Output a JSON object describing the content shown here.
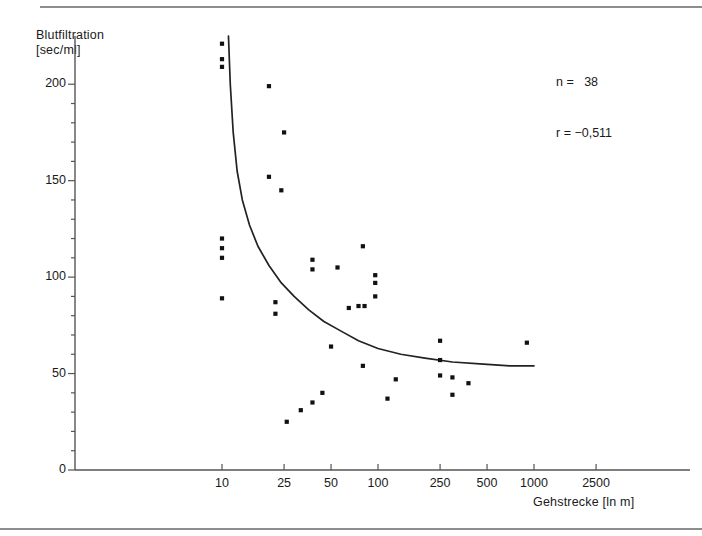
{
  "figure": {
    "background": "#ffffff",
    "ink": "#1a1a1a",
    "rule_color": "#8d8d8d"
  },
  "stats": {
    "n_label": "n =   38",
    "r_label": "r = −0,511"
  },
  "axes": {
    "y_title_line1": "Blutfiltration",
    "y_title_line2": "[sec/ml]",
    "x_title": "Gehstrecke [ln m]"
  },
  "chart_data": {
    "type": "scatter",
    "title": "",
    "subtitle": "",
    "xlabel": "Gehstrecke [ln m]",
    "ylabel": "Blutfiltration [sec/ml]",
    "x_scale": "log",
    "y_scale": "linear",
    "xlim": [
      5.5,
      4000
    ],
    "ylim": [
      0,
      225
    ],
    "grid": false,
    "legend_position": "top-right",
    "x_ticks": [
      10,
      25,
      50,
      100,
      250,
      500,
      1000,
      2500
    ],
    "x_tick_labels": [
      "10",
      "25",
      "50",
      "100",
      "250",
      "500",
      "1000",
      "2500"
    ],
    "y_ticks": [
      0,
      50,
      100,
      150,
      200
    ],
    "y_tick_labels": [
      "0",
      "50",
      "100",
      "150",
      "200"
    ],
    "y_minor_tick_step": 10,
    "annotations": [
      {
        "text": "n =   38",
        "x": 900,
        "y": 215
      },
      {
        "text": "r = −0,511",
        "x": 900,
        "y": 203
      }
    ],
    "series": [
      {
        "name": "Messpunkte",
        "type": "scatter",
        "marker": "square",
        "color": "#111111",
        "n": 38,
        "points": [
          {
            "x": 10,
            "y": 221
          },
          {
            "x": 10,
            "y": 213
          },
          {
            "x": 10,
            "y": 209
          },
          {
            "x": 20,
            "y": 199
          },
          {
            "x": 25,
            "y": 175
          },
          {
            "x": 20,
            "y": 152
          },
          {
            "x": 24,
            "y": 145
          },
          {
            "x": 10,
            "y": 120
          },
          {
            "x": 10,
            "y": 115
          },
          {
            "x": 10,
            "y": 110
          },
          {
            "x": 80,
            "y": 116
          },
          {
            "x": 38,
            "y": 109
          },
          {
            "x": 38,
            "y": 104
          },
          {
            "x": 55,
            "y": 105
          },
          {
            "x": 96,
            "y": 101
          },
          {
            "x": 96,
            "y": 97
          },
          {
            "x": 10,
            "y": 89
          },
          {
            "x": 22,
            "y": 87
          },
          {
            "x": 22,
            "y": 81
          },
          {
            "x": 75,
            "y": 85
          },
          {
            "x": 82,
            "y": 85
          },
          {
            "x": 96,
            "y": 90
          },
          {
            "x": 50,
            "y": 64
          },
          {
            "x": 250,
            "y": 67
          },
          {
            "x": 900,
            "y": 66
          },
          {
            "x": 250,
            "y": 57
          },
          {
            "x": 80,
            "y": 54
          },
          {
            "x": 130,
            "y": 47
          },
          {
            "x": 250,
            "y": 49
          },
          {
            "x": 300,
            "y": 48
          },
          {
            "x": 380,
            "y": 45
          },
          {
            "x": 115,
            "y": 37
          },
          {
            "x": 300,
            "y": 39
          },
          {
            "x": 44,
            "y": 40
          },
          {
            "x": 38,
            "y": 35
          },
          {
            "x": 32,
            "y": 31
          },
          {
            "x": 26,
            "y": 25
          },
          {
            "x": 65,
            "y": 84
          }
        ]
      },
      {
        "name": "Regressionskurve",
        "type": "line",
        "color": "#222222",
        "curve_points": [
          {
            "x": 11.0,
            "y": 225
          },
          {
            "x": 11.3,
            "y": 200
          },
          {
            "x": 11.8,
            "y": 175
          },
          {
            "x": 12.5,
            "y": 155
          },
          {
            "x": 13.5,
            "y": 140
          },
          {
            "x": 15.0,
            "y": 127
          },
          {
            "x": 17.0,
            "y": 116
          },
          {
            "x": 20.0,
            "y": 106
          },
          {
            "x": 24.0,
            "y": 97
          },
          {
            "x": 29.0,
            "y": 90
          },
          {
            "x": 36.0,
            "y": 83
          },
          {
            "x": 45.0,
            "y": 77
          },
          {
            "x": 58.0,
            "y": 72
          },
          {
            "x": 75.0,
            "y": 67
          },
          {
            "x": 100.0,
            "y": 63
          },
          {
            "x": 140.0,
            "y": 60
          },
          {
            "x": 200.0,
            "y": 58
          },
          {
            "x": 300.0,
            "y": 56
          },
          {
            "x": 450.0,
            "y": 55
          },
          {
            "x": 700.0,
            "y": 54
          },
          {
            "x": 1000.0,
            "y": 54
          }
        ]
      }
    ]
  }
}
